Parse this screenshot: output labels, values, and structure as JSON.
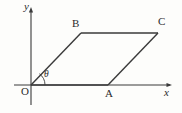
{
  "figure": {
    "kind": "geometry-diagram",
    "width": 182,
    "height": 113,
    "background_color": "#fdfdfb",
    "stroke_color": "#3a3a3a",
    "text_color": "#2b2b2b",
    "axes": {
      "origin": {
        "x": 31,
        "y": 85
      },
      "x_axis": {
        "label": "x",
        "start_x": 14,
        "end_x": 172,
        "y": 85,
        "arrow": "right"
      },
      "y_axis": {
        "label": "y",
        "x": 31,
        "start_y": 105,
        "end_y": 8,
        "arrow": "up"
      }
    },
    "angle": {
      "label": "θ",
      "at_vertex": "O",
      "between": [
        "OA",
        "OB"
      ],
      "arc_radius": 14
    },
    "points": [
      {
        "name": "O",
        "label": "O",
        "x": 31,
        "y": 85
      },
      {
        "name": "A",
        "label": "A",
        "x": 108,
        "y": 85
      },
      {
        "name": "B",
        "label": "B",
        "x": 81,
        "y": 33
      },
      {
        "name": "C",
        "label": "C",
        "x": 158,
        "y": 33
      }
    ],
    "edges": [
      {
        "name": "OA",
        "from": "O",
        "to": "A"
      },
      {
        "name": "AC",
        "from": "A",
        "to": "C"
      },
      {
        "name": "CB",
        "from": "C",
        "to": "B"
      },
      {
        "name": "BO",
        "from": "B",
        "to": "O"
      }
    ]
  }
}
